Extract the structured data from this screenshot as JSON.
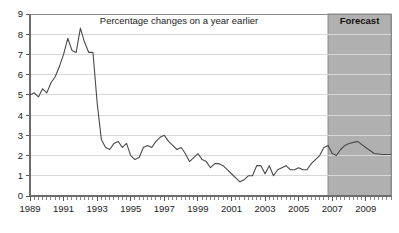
{
  "chart_data": {
    "type": "line",
    "title": "Percentage changes on a year earlier",
    "xlabel": "",
    "ylabel": "",
    "xlim": [
      1989.0,
      2010.5
    ],
    "ylim": [
      0,
      9
    ],
    "ytick_labels": [
      "0",
      "1",
      "2",
      "3",
      "4",
      "5",
      "6",
      "7",
      "8",
      "9"
    ],
    "ytick_values": [
      0,
      1,
      2,
      3,
      4,
      5,
      6,
      7,
      8,
      9
    ],
    "xtick_labels": [
      "1989",
      "1991",
      "1993",
      "1995",
      "1997",
      "1999",
      "2001",
      "2003",
      "2005",
      "2007",
      "2009"
    ],
    "xtick_values": [
      1989,
      1991,
      1993,
      1995,
      1997,
      1999,
      2001,
      2003,
      2005,
      2007,
      2009
    ],
    "grid": true,
    "legend": "none",
    "minor_tick_interval": 0.25,
    "annotations": [
      {
        "name": "forecast-band",
        "label": "Forecast",
        "x_start": 2006.75,
        "x_end": 2010.5
      }
    ],
    "series": [
      {
        "name": "Percentage change on a year earlier",
        "color": "#4a4a4a",
        "x": [
          1989.0,
          1989.25,
          1989.5,
          1989.75,
          1990.0,
          1990.25,
          1990.5,
          1990.75,
          1991.0,
          1991.25,
          1991.5,
          1991.75,
          1992.0,
          1992.25,
          1992.5,
          1992.75,
          1993.0,
          1993.25,
          1993.5,
          1993.75,
          1994.0,
          1994.25,
          1994.5,
          1994.75,
          1995.0,
          1995.25,
          1995.5,
          1995.75,
          1996.0,
          1996.25,
          1996.5,
          1996.75,
          1997.0,
          1997.25,
          1997.5,
          1997.75,
          1998.0,
          1998.25,
          1998.5,
          1998.75,
          1999.0,
          1999.25,
          1999.5,
          1999.75,
          2000.0,
          2000.25,
          2000.5,
          2000.75,
          2001.0,
          2001.25,
          2001.5,
          2001.75,
          2002.0,
          2002.25,
          2002.5,
          2002.75,
          2003.0,
          2003.25,
          2003.5,
          2003.75,
          2004.0,
          2004.25,
          2004.5,
          2004.75,
          2005.0,
          2005.25,
          2005.5,
          2005.75,
          2006.0,
          2006.25,
          2006.5,
          2006.75,
          2007.0,
          2007.25,
          2007.5,
          2007.75,
          2008.0,
          2008.5,
          2009.0,
          2009.5,
          2010.0,
          2010.5
        ],
        "values": [
          5.0,
          5.1,
          4.9,
          5.3,
          5.1,
          5.6,
          5.9,
          6.4,
          7.0,
          7.8,
          7.2,
          7.1,
          8.3,
          7.6,
          7.1,
          7.1,
          4.6,
          2.8,
          2.4,
          2.3,
          2.6,
          2.7,
          2.4,
          2.6,
          2.0,
          1.8,
          1.9,
          2.4,
          2.5,
          2.4,
          2.7,
          2.9,
          3.0,
          2.7,
          2.5,
          2.3,
          2.4,
          2.1,
          1.7,
          1.9,
          2.1,
          1.8,
          1.7,
          1.4,
          1.6,
          1.6,
          1.5,
          1.3,
          1.1,
          0.9,
          0.7,
          0.8,
          1.0,
          1.0,
          1.5,
          1.5,
          1.1,
          1.5,
          1.0,
          1.3,
          1.4,
          1.5,
          1.3,
          1.3,
          1.4,
          1.3,
          1.3,
          1.6,
          1.8,
          2.0,
          2.4,
          2.5,
          2.1,
          2.0,
          2.3,
          2.5,
          2.6,
          2.7,
          2.4,
          2.1,
          2.05,
          2.05
        ]
      }
    ]
  }
}
